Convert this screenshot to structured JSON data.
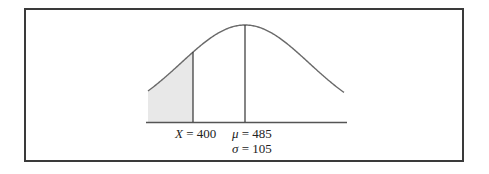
{
  "chart_data": {
    "type": "area",
    "title": "",
    "distribution": {
      "mean": 485,
      "sd": 105
    },
    "marker": {
      "x": 400
    },
    "shaded_region": "left tail, x < 400",
    "xlabel": "",
    "ylabel": "",
    "grid": false,
    "annotations": [
      {
        "symbol": "X",
        "text": "X = 400"
      },
      {
        "symbol": "μ",
        "text": "μ = 485"
      },
      {
        "symbol": "σ",
        "text": "σ = 105"
      }
    ]
  },
  "labels": {
    "x_sym": "X",
    "x_val": " = 400",
    "mu_sym": "μ",
    "mu_val": " = 485",
    "sigma_sym": "σ",
    "sigma_val": " = 105"
  },
  "colors": {
    "curve": "#6a6a6a",
    "shade": "#e8e8e8",
    "lines": "#333333",
    "frame": "#3a3a3a"
  }
}
